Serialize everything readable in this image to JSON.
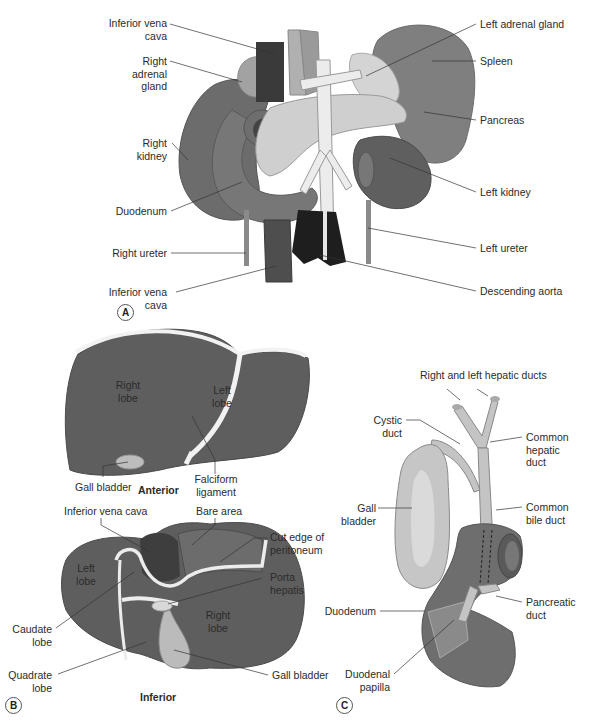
{
  "panel_a": {
    "badge": "A",
    "labels": {
      "ivc_top": [
        "Inferior vena",
        "cava"
      ],
      "right_adrenal": [
        "Right",
        "adrenal",
        "gland"
      ],
      "right_kidney": [
        "Right",
        "kidney"
      ],
      "duodenum": "Duodenum",
      "right_ureter": "Right ureter",
      "ivc_bottom": [
        "Inferior vena",
        "cava"
      ],
      "left_adrenal": "Left adrenal gland",
      "spleen": "Spleen",
      "pancreas": "Pancreas",
      "left_kidney": "Left kidney",
      "left_ureter": "Left ureter",
      "descending_aorta": "Descending aorta"
    }
  },
  "panel_b": {
    "badge": "B",
    "anterior": {
      "view_title": "Anterior",
      "right_lobe": [
        "Right",
        "lobe"
      ],
      "left_lobe": [
        "Left",
        "lobe"
      ],
      "gall_bladder": "Gall bladder",
      "falciform": [
        "Falciform",
        "ligament"
      ]
    },
    "inferior": {
      "view_title": "Inferior",
      "ivc": "Inferior vena cava",
      "bare_area": "Bare area",
      "cut_edge": [
        "Cut edge of",
        "peritoneum"
      ],
      "porta_hepatis": [
        "Porta",
        "hepatis"
      ],
      "left_lobe": [
        "Left",
        "lobe"
      ],
      "right_lobe": [
        "Right",
        "lobe"
      ],
      "caudate_lobe": [
        "Caudate",
        "lobe"
      ],
      "quadrate_lobe": [
        "Quadrate",
        "lobe"
      ],
      "gall_bladder": "Gall bladder"
    }
  },
  "panel_c": {
    "badge": "C",
    "hepatic_ducts": "Right and left hepatic ducts",
    "cystic_duct": [
      "Cystic",
      "duct"
    ],
    "common_hepatic_duct": [
      "Common",
      "hepatic",
      "duct"
    ],
    "gall_bladder": [
      "Gall",
      "bladder"
    ],
    "common_bile_duct": [
      "Common",
      "bile duct"
    ],
    "duodenum": "Duodenum",
    "pancreatic_duct": [
      "Pancreatic",
      "duct"
    ],
    "duodenal_papilla": [
      "Duodenal",
      "papilla"
    ]
  },
  "colors": {
    "organ_dark": "#5e5e5e",
    "organ_mid": "#7a7a7a",
    "organ_light": "#9a9a9a",
    "pale": "#c9c9c9",
    "vessel": "#e8e8e8",
    "black": "#1e1e1e",
    "leader": "#333333"
  }
}
